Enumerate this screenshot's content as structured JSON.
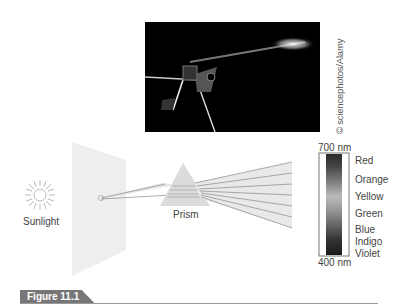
{
  "photo": {
    "credit": "© sciencephotos/Alamy"
  },
  "diagram": {
    "source_label": "Sunlight",
    "prism_label": "Prism",
    "spectrum_top": "700 nm",
    "spectrum_bottom": "400 nm",
    "colors": [
      "Red",
      "Orange",
      "Yellow",
      "Green",
      "Blue",
      "Indigo",
      "Violet"
    ]
  },
  "figure": {
    "label": "Figure 11.1"
  }
}
